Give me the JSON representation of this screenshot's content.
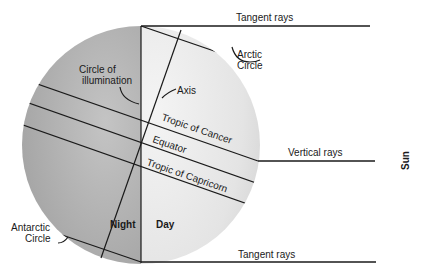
{
  "diagram": {
    "labels": {
      "tangent_rays_top": "Tangent rays",
      "tangent_rays_bottom": "Tangent rays",
      "vertical_rays": "Vertical rays",
      "sun": "Sun",
      "arctic_circle_line1": "Arctic",
      "arctic_circle_line2": "Circle",
      "antarctic_circle_line1": "Antarctic",
      "antarctic_circle_line2": "Circle",
      "circle_of_illumination_line1": "Circle of",
      "circle_of_illumination_line2": "illumination",
      "axis": "Axis",
      "tropic_of_cancer": "Tropic of Cancer",
      "equator": "Equator",
      "tropic_of_capricorn": "Tropic of Capricorn",
      "night": "Night",
      "day": "Day"
    },
    "colors": {
      "night_side": "#a9a9a9",
      "day_side": "#e6e6e6",
      "line": "#1a1a1a",
      "background": "#ffffff"
    }
  }
}
